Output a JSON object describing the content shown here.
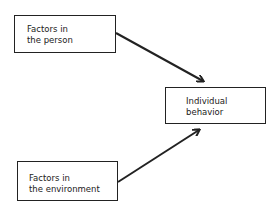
{
  "diagram": {
    "nodes": [
      {
        "id": "person",
        "lines": [
          "Factors in",
          "the person"
        ]
      },
      {
        "id": "behavior",
        "lines": [
          "Individual",
          "behavior"
        ]
      },
      {
        "id": "environment",
        "lines": [
          "Factors in",
          "the environment"
        ]
      }
    ],
    "edges": [
      {
        "from": "person",
        "to": "behavior"
      },
      {
        "from": "environment",
        "to": "behavior"
      }
    ]
  }
}
